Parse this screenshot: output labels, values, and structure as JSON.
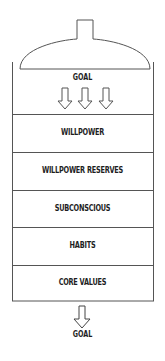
{
  "diagram": {
    "top_label": "GOAL",
    "layers": [
      {
        "label": "WILLPOWER"
      },
      {
        "label": "WILLPOWER RESERVES"
      },
      {
        "label": "SUBCONSCIOUS"
      },
      {
        "label": "HABITS"
      },
      {
        "label": "CORE VALUES"
      }
    ],
    "bottom_label": "GOAL",
    "colors": {
      "line": "#555555",
      "text": "#1e1e1e",
      "background": "#ffffff"
    }
  }
}
